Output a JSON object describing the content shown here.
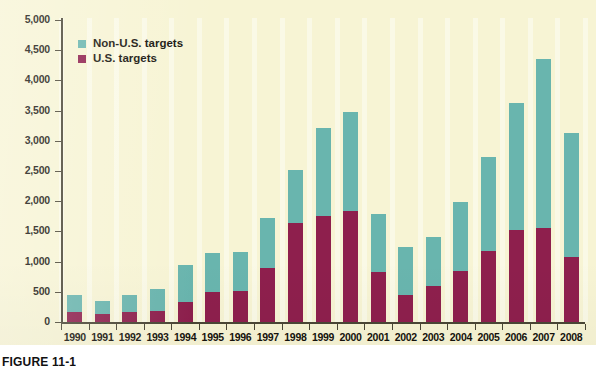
{
  "figure": {
    "caption": "FIGURE 11-1",
    "background_color": "#f7f4d4"
  },
  "legend": {
    "position": "top-left-inside",
    "entries": [
      {
        "label": "Non-U.S. targets",
        "color": "#69b5ae",
        "swatch_name": "legend-swatch-non-us"
      },
      {
        "label": "U.S. targets",
        "color": "#8e1f4d",
        "swatch_name": "legend-swatch-us"
      }
    ]
  },
  "chart_data": {
    "type": "bar",
    "stacked": true,
    "title": "",
    "subtitle": "",
    "xlabel": "",
    "ylabel": "",
    "grid": false,
    "ylim": [
      0,
      5000
    ],
    "ytick_step": 500,
    "categories": [
      "1990",
      "1991",
      "1992",
      "1993",
      "1994",
      "1995",
      "1996",
      "1997",
      "1998",
      "1999",
      "2000",
      "2001",
      "2002",
      "2003",
      "2004",
      "2005",
      "2006",
      "2007",
      "2008"
    ],
    "ytick_labels": [
      "0",
      "500",
      "1,000",
      "1,500",
      "2,000",
      "2,500",
      "3,000",
      "3,500",
      "4,000",
      "4,500",
      "5,000"
    ],
    "ytick_values": [
      0,
      500,
      1000,
      1500,
      2000,
      2500,
      3000,
      3500,
      4000,
      4500,
      5000
    ],
    "series": [
      {
        "name": "U.S. targets",
        "color": "#8e1f4d",
        "values": [
          170,
          140,
          160,
          180,
          330,
          500,
          520,
          900,
          1640,
          1750,
          1830,
          830,
          450,
          590,
          850,
          1170,
          1530,
          1550,
          1070
        ]
      },
      {
        "name": "Non-U.S. targets",
        "color": "#69b5ae",
        "values": [
          270,
          210,
          290,
          370,
          620,
          650,
          640,
          820,
          880,
          1470,
          1640,
          960,
          790,
          810,
          1140,
          1560,
          2090,
          2800,
          2060
        ]
      }
    ],
    "totals": [
      440,
      350,
      450,
      550,
      950,
      1150,
      1160,
      1720,
      2520,
      3220,
      3470,
      1790,
      1240,
      1400,
      1990,
      2730,
      3620,
      4350,
      3130
    ]
  }
}
